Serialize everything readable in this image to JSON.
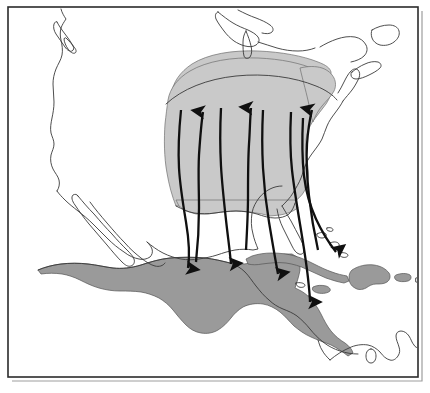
{
  "figure": {
    "title": "Bird migration range and flyway map of North and Central America",
    "background_color": "#ffffff",
    "width": 430,
    "height": 393
  },
  "frame": {
    "name": "map-border",
    "x": 8,
    "y": 7,
    "width": 410,
    "height": 370,
    "stroke_color": "#2b2b2b",
    "shadow_color": "#9d9d9d"
  },
  "legend_colors": {
    "breeding_range": "#c9c9c9",
    "wintering_range": "#9a9a9a",
    "coastline": "#3a3a3a",
    "arrow": "#101010",
    "ocean": "#ffffff"
  },
  "ranges": [
    {
      "id": "breeding-range",
      "label": "Breeding range",
      "color": "#c9c9c9",
      "region": "Eastern and central United States",
      "description": "Light gray shading extending from the Gulf Coast north to the Great Lakes and northeast to New England"
    },
    {
      "id": "wintering-range",
      "label": "Wintering range",
      "color": "#9a9a9a",
      "region": "Southern Mexico, Central America and the Greater Antilles",
      "description": "Darker gray shading over southern Mexico, Guatemala, Honduras, Nicaragua, Costa Rica, Panama, Cuba, Jamaica, Hispaniola and Puerto Rico"
    }
  ],
  "landmasses": [
    {
      "id": "north-america-mainland",
      "label": "North America"
    },
    {
      "id": "vancouver-island",
      "label": "Vancouver Island"
    },
    {
      "id": "baja-california",
      "label": "Baja California"
    },
    {
      "id": "cuba",
      "label": "Cuba"
    },
    {
      "id": "jamaica",
      "label": "Jamaica"
    },
    {
      "id": "hispaniola",
      "label": "Hispaniola"
    },
    {
      "id": "puerto-rico",
      "label": "Puerto Rico"
    },
    {
      "id": "bahamas",
      "label": "Bahamas"
    },
    {
      "id": "south-america-north",
      "label": "Northern South America"
    }
  ],
  "flyways": [
    {
      "id": "flyway-1",
      "label": "Western Gulf flyway",
      "direction": "south",
      "arrowhead": "south",
      "origin": "Central United States",
      "destination": "Southern Mexico"
    },
    {
      "id": "flyway-2",
      "label": "Central flyway north",
      "direction": "north",
      "arrowhead": "north",
      "origin": "Gulf Coast",
      "destination": "Midwestern United States"
    },
    {
      "id": "flyway-3",
      "label": "Trans-Gulf flyway",
      "direction": "south",
      "arrowhead": "south",
      "origin": "Mississippi Valley",
      "destination": "Veracruz, Mexico"
    },
    {
      "id": "flyway-4",
      "label": "Mississippi flyway north",
      "direction": "north",
      "arrowhead": "north",
      "origin": "Gulf of Mexico",
      "destination": "Great Lakes region"
    },
    {
      "id": "flyway-5",
      "label": "Yucatan flyway",
      "direction": "south",
      "arrowhead": "south",
      "origin": "Southeastern United States",
      "destination": "Yucatan Peninsula and Guatemala"
    },
    {
      "id": "flyway-6",
      "label": "Central American flyway",
      "direction": "south",
      "arrowhead": "south",
      "origin": "Florida and Gulf Coast",
      "destination": "Honduras and Nicaragua"
    },
    {
      "id": "flyway-7",
      "label": "Atlantic coastal flyway north",
      "direction": "north",
      "arrowhead": "north",
      "origin": "Florida",
      "destination": "New England"
    },
    {
      "id": "flyway-8",
      "label": "Caribbean flyway to Cuba",
      "direction": "south",
      "arrowhead": "south",
      "origin": "Atlantic coast",
      "destination": "Cuba"
    }
  ],
  "arrow_counts": {
    "northward": 3,
    "southward": 5,
    "total": 8
  }
}
